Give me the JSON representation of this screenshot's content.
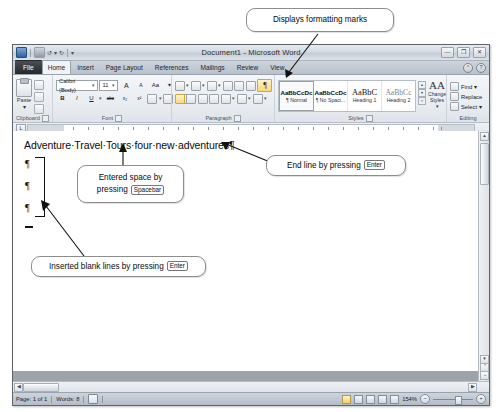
{
  "callouts": {
    "top": {
      "text": "Displays formatting marks"
    },
    "space": {
      "line1": "Entered space by",
      "line2_prefix": "pressing",
      "key": "Spacebar"
    },
    "end_line": {
      "prefix": "End line by pressing",
      "key": "Enter"
    },
    "blank_lines": {
      "prefix": "Inserted blank lines by pressing",
      "key": "Enter"
    }
  },
  "window": {
    "title": "Document1 - Microsoft Word",
    "minimize_label": "—",
    "restore_label": "❐",
    "close_label": "✕",
    "help_label": "?",
    "ribbon_collapse_label": "^",
    "quick_access": [
      "word-icon",
      "save-icon",
      "undo-icon",
      "redo-icon",
      "customize-icon"
    ]
  },
  "tabs": [
    {
      "label": "File",
      "active": false,
      "kind": "file"
    },
    {
      "label": "Home",
      "active": true,
      "kind": "normal"
    },
    {
      "label": "Insert",
      "active": false,
      "kind": "normal"
    },
    {
      "label": "Page Layout",
      "active": false,
      "kind": "normal"
    },
    {
      "label": "References",
      "active": false,
      "kind": "normal"
    },
    {
      "label": "Mailings",
      "active": false,
      "kind": "normal"
    },
    {
      "label": "Review",
      "active": false,
      "kind": "normal"
    },
    {
      "label": "View",
      "active": false,
      "kind": "normal"
    }
  ],
  "ribbon": {
    "groups": [
      {
        "name": "Clipboard",
        "label": "Clipboard"
      },
      {
        "name": "Font",
        "label": "Font"
      },
      {
        "name": "Paragraph",
        "label": "Paragraph"
      },
      {
        "name": "Styles",
        "label": "Styles"
      },
      {
        "name": "Editing",
        "label": "Editing"
      }
    ],
    "clipboard": {
      "paste_label": "Paste",
      "paste_caret": "▾",
      "cut_label": "cut-icon",
      "copy_label": "copy-icon",
      "format_painter_label": "format-painter-icon"
    },
    "font": {
      "font_name": "Calibri (Body)",
      "font_size": "11",
      "grow_label": "A",
      "shrink_label": "A",
      "change_case_label": "Aa",
      "clear_formatting_label": "✦",
      "bold_label": "B",
      "italic_label": "I",
      "underline_label": "U",
      "strikethrough_label": "abc",
      "subscript_label": "x₂",
      "superscript_label": "x²",
      "text_effects_label": "A",
      "highlight_label": "ab",
      "font_color_label": "A",
      "caret": "▾"
    },
    "paragraph": {
      "bullets_label": "☰",
      "numbering_label": "☰",
      "multilevel_label": "☰",
      "decrease_indent_label": "◄",
      "increase_indent_label": "►",
      "sort_label": "↓",
      "show_marks_label": "¶",
      "show_marks_selected": true,
      "align_left_label": "☰",
      "align_center_label": "☰",
      "align_right_label": "☰",
      "justify_label": "☰",
      "line_spacing_label": "↕",
      "shading_label": "▦",
      "borders_label": "▤",
      "caret": "▾"
    },
    "styles": {
      "items": [
        {
          "preview": "AaBbCcDc",
          "name": "¶ Normal",
          "active": true,
          "style": "sans"
        },
        {
          "preview": "AaBbCcDc",
          "name": "¶ No Spaci...",
          "active": false,
          "style": "sans"
        },
        {
          "preview": "AaBbC",
          "name": "Heading 1",
          "active": false,
          "style": "big"
        },
        {
          "preview": "AaBbCc",
          "name": "Heading 2",
          "active": false,
          "style": "grey"
        }
      ],
      "nav_up": "▴",
      "nav_down": "▾",
      "nav_more": "▿",
      "change_styles_icon": "AA",
      "change_styles_line1": "Change",
      "change_styles_line2": "Styles ▾"
    },
    "editing": {
      "find_label": "Find ▾",
      "replace_label": "Replace",
      "select_label": "Select ▾"
    }
  },
  "document": {
    "text_line": "Adventure·Travel·Tours·four·new·adventures¶",
    "paragraph_marks": [
      "¶",
      "¶",
      "¶"
    ],
    "cursor_mark": "—"
  },
  "statusbar": {
    "page_info": "Page: 1 of 1",
    "word_count": "Words: 8",
    "proofing_icon": "proofing-icon",
    "view_buttons": [
      "print-layout",
      "full-screen-reading",
      "web-layout",
      "outline",
      "draft"
    ],
    "zoom_level": "154%",
    "zoom_out_label": "−",
    "zoom_in_label": "+"
  },
  "colors": {
    "highlight": "#f6d97a",
    "window_border": "#5f6468",
    "canvas_gray": "#9ea3a9",
    "file_tab": "#24282c"
  }
}
